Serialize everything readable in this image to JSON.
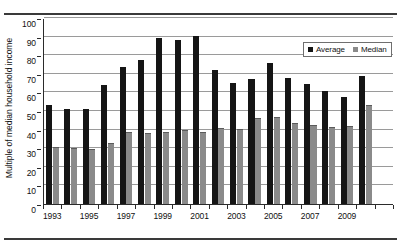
{
  "chart_data": {
    "type": "bar",
    "title": "",
    "xlabel": "",
    "ylabel": "Multiple of median household income",
    "ylim": [
      0,
      100
    ],
    "ytick_step": 10,
    "yticks": [
      0,
      10,
      20,
      30,
      40,
      50,
      60,
      70,
      80,
      90,
      100
    ],
    "grid": true,
    "legend_position": "top-right",
    "categories": [
      "1993",
      "1994",
      "1995",
      "1996",
      "1997",
      "1998",
      "1999",
      "2000",
      "2001",
      "2002",
      "2003",
      "2004",
      "2005",
      "2006",
      "2007",
      "2008",
      "2009",
      "2010",
      "2011"
    ],
    "xtick_labels": [
      "1993",
      "1995",
      "1997",
      "1999",
      "2001",
      "2003",
      "2005",
      "2007",
      "2009"
    ],
    "series": [
      {
        "name": "Average",
        "color": "#151515",
        "values": [
          53,
          51,
          51,
          64,
          73.5,
          77.5,
          89,
          88,
          90.5,
          72,
          65,
          67,
          76,
          68,
          64.5,
          61,
          57.5,
          69,
          0
        ]
      },
      {
        "name": "Median",
        "color": "#8a8a8a",
        "values": [
          30.5,
          30,
          29.5,
          33,
          38.5,
          38,
          38.5,
          40,
          38.5,
          41,
          40.5,
          46,
          47,
          43.5,
          42.5,
          41.5,
          42,
          53.5,
          0
        ]
      }
    ]
  },
  "legend": {
    "items": [
      {
        "label": "Average"
      },
      {
        "label": "Median"
      }
    ]
  }
}
